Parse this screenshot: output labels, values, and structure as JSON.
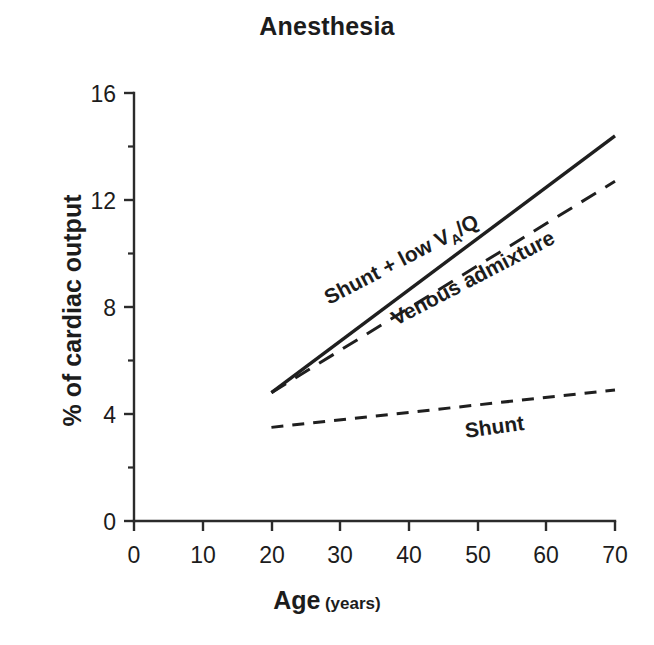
{
  "chart_data": {
    "type": "line",
    "title": "Anesthesia",
    "xlabel_main": "Age",
    "xlabel_sub": "(years)",
    "ylabel": "% of cardiac output",
    "xlim": [
      0,
      70
    ],
    "ylim": [
      0,
      16
    ],
    "xticks": [
      0,
      10,
      20,
      30,
      40,
      50,
      60,
      70
    ],
    "xtick_labels": [
      "0",
      "10",
      "20",
      "30",
      "40",
      "50",
      "60",
      "70"
    ],
    "yticks": [
      0,
      4,
      8,
      12,
      16
    ],
    "ytick_labels": [
      "0",
      "4",
      "8",
      "12",
      "16"
    ],
    "yticks_minor": [
      2,
      6,
      10,
      14
    ],
    "grid": false,
    "legend_position": "inline-labels",
    "series": [
      {
        "name": "Shunt + low VA/Q",
        "label_main": "Shunt + low V",
        "label_sub": "A",
        "label_tail": "/Q",
        "style": "solid",
        "x": [
          20,
          70
        ],
        "values": [
          4.8,
          14.4
        ]
      },
      {
        "name": "Venous admixture",
        "label_main": "Venous admixture",
        "style": "long-dashed",
        "x": [
          20,
          70
        ],
        "values": [
          4.8,
          12.7
        ]
      },
      {
        "name": "Shunt",
        "label_main": "Shunt",
        "style": "short-dashed",
        "x": [
          20,
          70
        ],
        "values": [
          3.5,
          4.9
        ]
      }
    ],
    "colors": {
      "line": "#1f1f1f",
      "axis": "#2b2b2b",
      "text": "#1c1c1c",
      "background": "#ffffff"
    }
  }
}
